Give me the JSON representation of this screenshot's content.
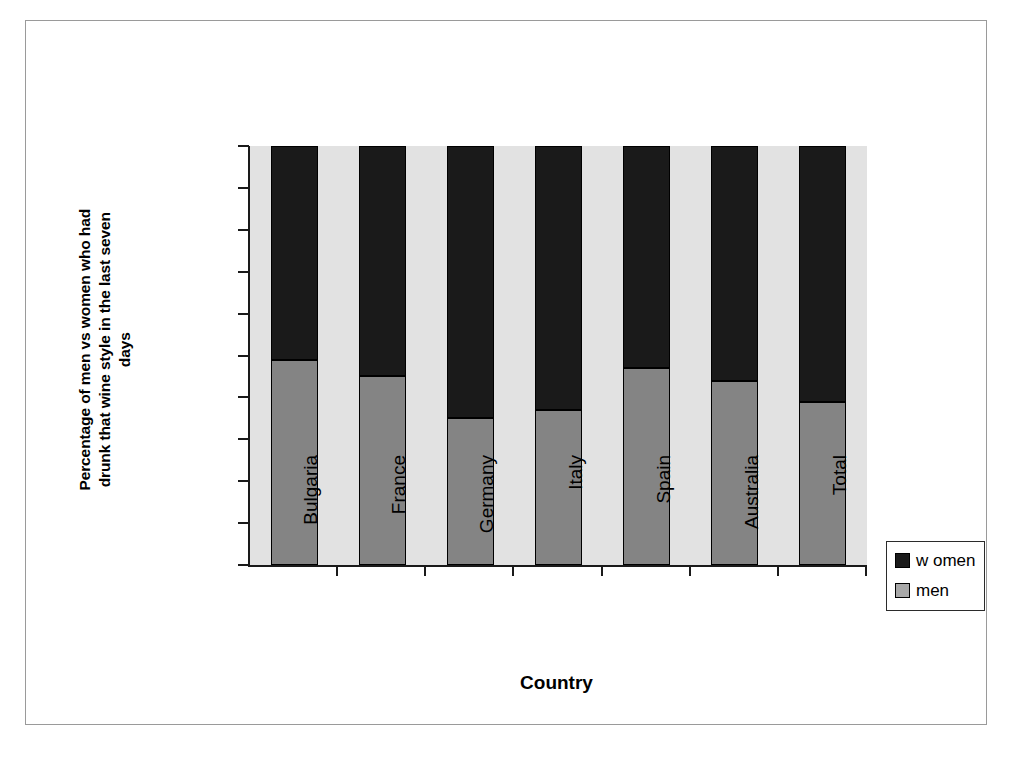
{
  "chart_data": {
    "type": "bar",
    "subtype": "stacked-100-percent",
    "title": "",
    "xlabel": "Country",
    "ylabel": "Percentage of men vs women who had drunk that wine style in the last seven days",
    "ylabel_lines": [
      "Percentage of men vs women who had",
      "drunk that wine style in the last seven",
      "days"
    ],
    "categories": [
      "Bulgaria",
      "France",
      "Germany",
      "Italy",
      "Spain",
      "Australia",
      "Total"
    ],
    "series": [
      {
        "name": "w omen",
        "color": "#1a1a1a",
        "values": [
          51,
          55,
          65,
          63,
          53,
          56,
          61
        ]
      },
      {
        "name": "men",
        "color": "#848484",
        "values": [
          49,
          45,
          35,
          37,
          47,
          44,
          39
        ]
      }
    ],
    "ylim": [
      0,
      100
    ],
    "ytick_labels": [
      "100%",
      "90%",
      "80%",
      "70%",
      "60%",
      "50%",
      "40%",
      "30%",
      "20%",
      "10%",
      "0%"
    ],
    "ytick_values": [
      100,
      90,
      80,
      70,
      60,
      50,
      40,
      30,
      20,
      10,
      0
    ],
    "grid": false,
    "legend_position": "right-bottom",
    "plot_background": "#e2e2e2"
  },
  "legend": {
    "entries": [
      {
        "label": "w omen",
        "swatch": "women"
      },
      {
        "label": "men",
        "swatch": "men"
      }
    ]
  }
}
